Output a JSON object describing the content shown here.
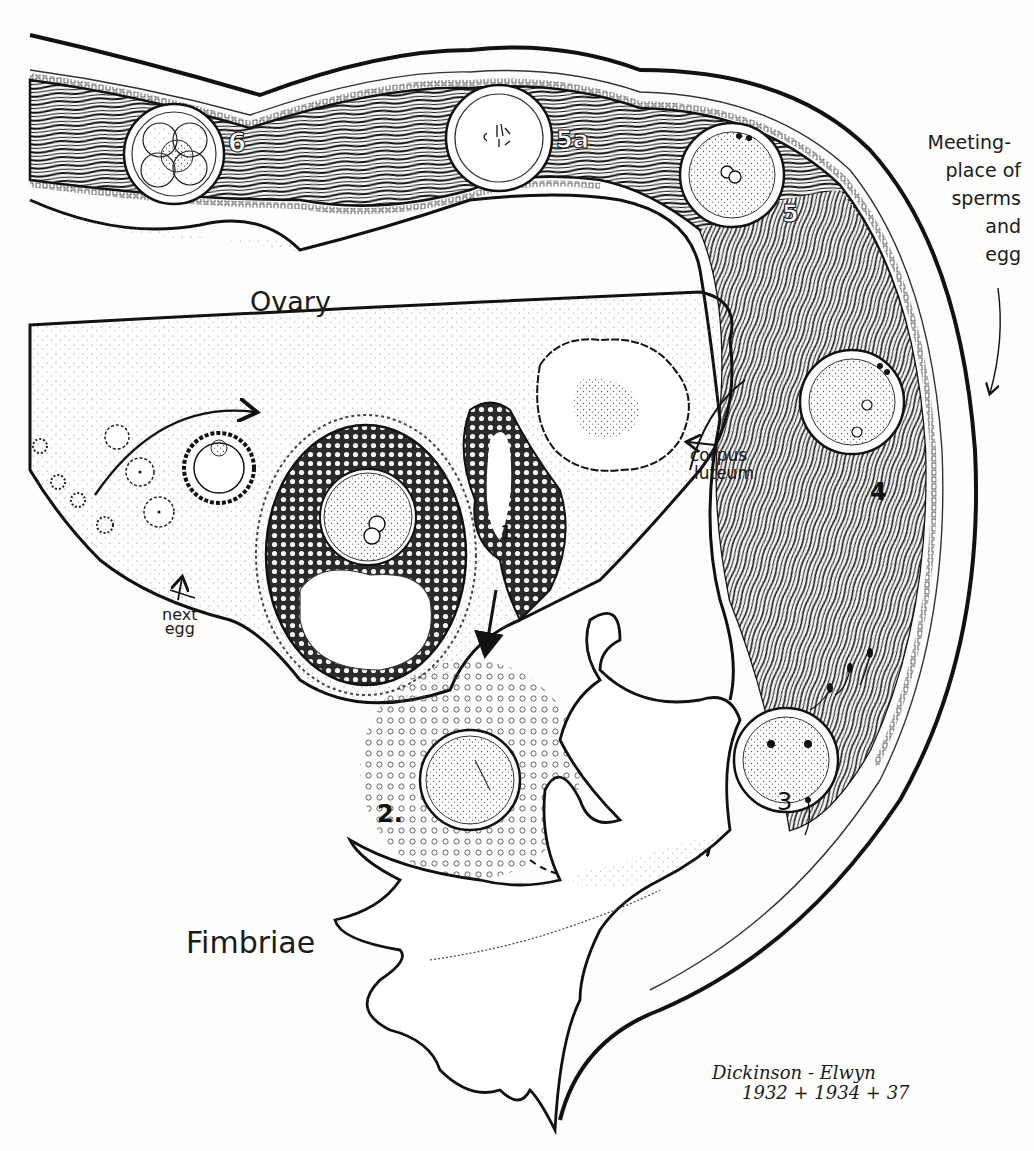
{
  "figure": {
    "type": "anatomical-illustration",
    "colors": {
      "ink": "#1a1a1a",
      "paper": "#fdfdfc",
      "stipple": "#555555"
    }
  },
  "labels": {
    "ovary": "Ovary",
    "fimbriae": "Fimbriae",
    "corpus_luteum_line1": "corpus",
    "corpus_luteum_line2": "luteum",
    "next_egg_line1": "next",
    "next_egg_line2": "egg",
    "meeting_place": [
      "Meeting-",
      "place of",
      "sperms",
      "and",
      "egg"
    ]
  },
  "stage_numbers": {
    "s1": "1.",
    "s2": "2.",
    "s3": "3",
    "s4": "4",
    "s5": "5",
    "s5a": "5a",
    "s6": "6"
  },
  "signature": {
    "line1": "Dickinson - Elwyn",
    "line2": "1932 + 1934 + 37"
  }
}
